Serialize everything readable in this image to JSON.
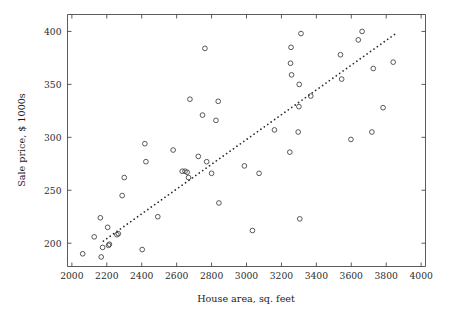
{
  "chart_data": {
    "type": "scatter",
    "title": "",
    "xlabel": "House area, sq. feet",
    "ylabel": "Sale price, $ 1000s",
    "xlim": [
      1975,
      4025
    ],
    "ylim": [
      178,
      416
    ],
    "grid": false,
    "legend": "none",
    "marker": "open-circle",
    "xticks": [
      2000,
      2200,
      2400,
      2600,
      2800,
      3000,
      3200,
      3400,
      3600,
      3800,
      4000
    ],
    "xtick_labels": [
      "2000",
      "2200",
      "2400",
      "2600",
      "2800",
      "3000",
      "3200",
      "3400",
      "3600",
      "3800",
      "4000"
    ],
    "yticks": [
      200,
      250,
      300,
      350,
      400
    ],
    "ytick_labels": [
      "200",
      "250",
      "300",
      "350",
      "400"
    ],
    "points": [
      {
        "x": 2062,
        "y": 190
      },
      {
        "x": 2128,
        "y": 206
      },
      {
        "x": 2163,
        "y": 224
      },
      {
        "x": 2168,
        "y": 187
      },
      {
        "x": 2176,
        "y": 196
      },
      {
        "x": 2205,
        "y": 215
      },
      {
        "x": 2210,
        "y": 198
      },
      {
        "x": 2215,
        "y": 199
      },
      {
        "x": 2258,
        "y": 208
      },
      {
        "x": 2266,
        "y": 209
      },
      {
        "x": 2288,
        "y": 245
      },
      {
        "x": 2300,
        "y": 262
      },
      {
        "x": 2403,
        "y": 194
      },
      {
        "x": 2418,
        "y": 294
      },
      {
        "x": 2424,
        "y": 277
      },
      {
        "x": 2492,
        "y": 225
      },
      {
        "x": 2580,
        "y": 288
      },
      {
        "x": 2632,
        "y": 268
      },
      {
        "x": 2648,
        "y": 268
      },
      {
        "x": 2660,
        "y": 267
      },
      {
        "x": 2668,
        "y": 262
      },
      {
        "x": 2676,
        "y": 336
      },
      {
        "x": 2724,
        "y": 282
      },
      {
        "x": 2748,
        "y": 321
      },
      {
        "x": 2762,
        "y": 384
      },
      {
        "x": 2772,
        "y": 277
      },
      {
        "x": 2800,
        "y": 266
      },
      {
        "x": 2825,
        "y": 316
      },
      {
        "x": 2838,
        "y": 334
      },
      {
        "x": 2842,
        "y": 238
      },
      {
        "x": 2988,
        "y": 273
      },
      {
        "x": 3034,
        "y": 212
      },
      {
        "x": 3072,
        "y": 266
      },
      {
        "x": 3160,
        "y": 307
      },
      {
        "x": 3248,
        "y": 286
      },
      {
        "x": 3252,
        "y": 370
      },
      {
        "x": 3255,
        "y": 385
      },
      {
        "x": 3258,
        "y": 359
      },
      {
        "x": 3296,
        "y": 305
      },
      {
        "x": 3300,
        "y": 329
      },
      {
        "x": 3302,
        "y": 350
      },
      {
        "x": 3305,
        "y": 223
      },
      {
        "x": 3312,
        "y": 398
      },
      {
        "x": 3368,
        "y": 339
      },
      {
        "x": 3538,
        "y": 378
      },
      {
        "x": 3545,
        "y": 355
      },
      {
        "x": 3598,
        "y": 298
      },
      {
        "x": 3640,
        "y": 392
      },
      {
        "x": 3662,
        "y": 400
      },
      {
        "x": 3718,
        "y": 305
      },
      {
        "x": 3726,
        "y": 365
      },
      {
        "x": 3782,
        "y": 328
      },
      {
        "x": 3840,
        "y": 371
      }
    ],
    "trend_line": {
      "style": "dotted",
      "x_start": 2180,
      "y_start": 202,
      "x_end": 3855,
      "y_end": 398
    }
  }
}
